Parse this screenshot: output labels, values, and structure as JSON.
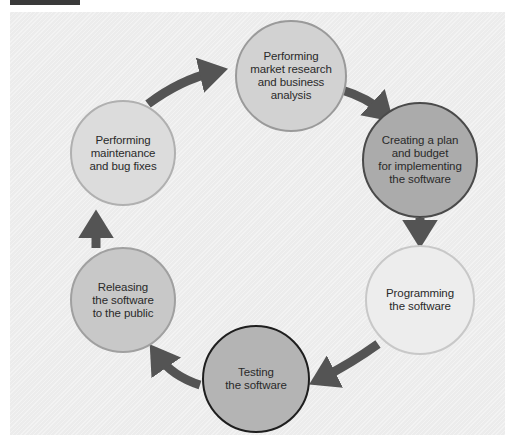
{
  "diagram": {
    "type": "cycle",
    "title": "",
    "steps": [
      {
        "id": "research",
        "label": "Performing\nmarket research\nand business\nanalysis",
        "fill": "#d2d2d2",
        "border": "#9a9a9a"
      },
      {
        "id": "plan",
        "label": "Creating a plan\nand budget\nfor implementing\nthe software",
        "fill": "#ababab",
        "border": "#4a4a4a"
      },
      {
        "id": "programming",
        "label": "Programming\nthe software",
        "fill": "#ededed",
        "border": "#c8c8c8"
      },
      {
        "id": "testing",
        "label": "Testing\nthe software",
        "fill": "#b4b4b4",
        "border": "#1e1e1e"
      },
      {
        "id": "releasing",
        "label": "Releasing\nthe software\nto the public",
        "fill": "#c8c8c8",
        "border": "#a0a0a0"
      },
      {
        "id": "maintenance",
        "label": "Performing\nmaintenance\nand bug fixes",
        "fill": "#dcdcdc",
        "border": "#b0b0b0"
      }
    ],
    "arrow_color": "#545454",
    "frame_color": "#ececec"
  }
}
